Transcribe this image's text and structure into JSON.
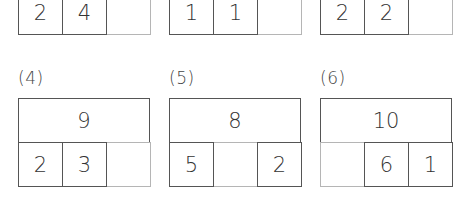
{
  "problems": [
    {
      "label": "",
      "total": "",
      "parts": [
        "2",
        "4",
        ""
      ]
    },
    {
      "label": "",
      "total": "",
      "parts": [
        "1",
        "1",
        ""
      ]
    },
    {
      "label": "",
      "total": "",
      "parts": [
        "2",
        "2",
        ""
      ]
    },
    {
      "label": "(4)",
      "total": "9",
      "parts": [
        "2",
        "3",
        ""
      ]
    },
    {
      "label": "(5)",
      "total": "8",
      "parts": [
        "5",
        "",
        "2"
      ]
    },
    {
      "label": "(6)",
      "total": "10",
      "parts": [
        "",
        "6",
        "1"
      ]
    }
  ],
  "colors": {
    "line": "#555555",
    "empty_line": "#b5b5b5",
    "text": "#333333"
  }
}
